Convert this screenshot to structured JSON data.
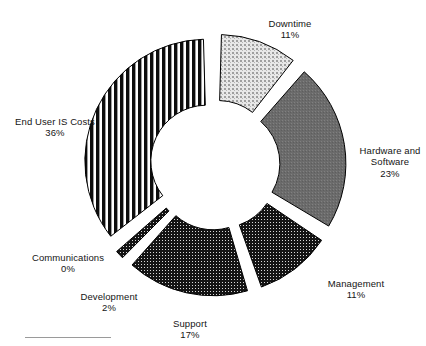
{
  "chart": {
    "type": "donut",
    "center": {
      "x": 215,
      "y": 165
    },
    "inner_radius": 56,
    "outer_radius": 122,
    "explode": 9,
    "start_angle_deg": -90,
    "direction": "clockwise",
    "background_color": "#ffffff",
    "outline_color": "#000000"
  },
  "chart_data": {
    "type": "pie",
    "title": "",
    "subtitle": "",
    "xlabel": "",
    "ylabel": "",
    "legend_position": "none",
    "labels_position": "outside",
    "units": "percent",
    "total": 100,
    "categories": [
      "Downtime",
      "Hardware and Software",
      "Management",
      "Support",
      "Development",
      "Communications",
      "End User IS Costs"
    ],
    "values": [
      11,
      23,
      11,
      17,
      2,
      0,
      36
    ],
    "value_labels": [
      "11%",
      "23%",
      "11%",
      "17%",
      "2%",
      "0%",
      "36%"
    ],
    "slice_fills": [
      "#d2d2d2",
      "#6e6e6e",
      "#2b2b2b",
      "#1c1c1c",
      "#1c1c1c",
      "#1c1c1c",
      "#111111"
    ],
    "slice_patterns": [
      "light-grid-dots",
      "medium-gray-fine",
      "dark-dots",
      "dark-dots",
      "dark-dots",
      "dark-dots",
      "vertical-stripes"
    ]
  },
  "slices": [
    {
      "name": "Downtime",
      "label": "Downtime",
      "percent_label": "11%",
      "value": 11,
      "fill": "#d2d2d2",
      "pattern": "light-grid-dots",
      "label_pos": {
        "x": 235,
        "y": 6,
        "w": 110
      }
    },
    {
      "name": "Hardware and Software",
      "label": "Hardware and\nSoftware",
      "percent_label": "23%",
      "value": 23,
      "fill": "#6e6e6e",
      "pattern": "medium-gray-fine",
      "label_pos": {
        "x": 355,
        "y": 133,
        "w": 70
      }
    },
    {
      "name": "Management",
      "label": "Management",
      "percent_label": "11%",
      "value": 11,
      "fill": "#2b2b2b",
      "pattern": "dark-dots",
      "label_pos": {
        "x": 313,
        "y": 266,
        "w": 86
      }
    },
    {
      "name": "Support",
      "label": "Support",
      "percent_label": "17%",
      "value": 17,
      "fill": "#1c1c1c",
      "pattern": "dark-dots",
      "label_pos": {
        "x": 150,
        "y": 306,
        "w": 80
      }
    },
    {
      "name": "Development",
      "label": "Development",
      "percent_label": "2%",
      "value": 2,
      "fill": "#1c1c1c",
      "pattern": "dark-dots",
      "label_pos": {
        "x": 64,
        "y": 279,
        "w": 90
      }
    },
    {
      "name": "Communications",
      "label": "Communications",
      "percent_label": "0%",
      "value": 0,
      "fill": "#1c1c1c",
      "pattern": "dark-dots",
      "label_pos": {
        "x": 18,
        "y": 240,
        "w": 100
      }
    },
    {
      "name": "End User IS Costs",
      "label": "End User IS Costs",
      "percent_label": "36%",
      "value": 36,
      "fill": "#111111",
      "pattern": "vertical-stripes",
      "label_pos": {
        "x": 3,
        "y": 104,
        "w": 104
      }
    }
  ]
}
